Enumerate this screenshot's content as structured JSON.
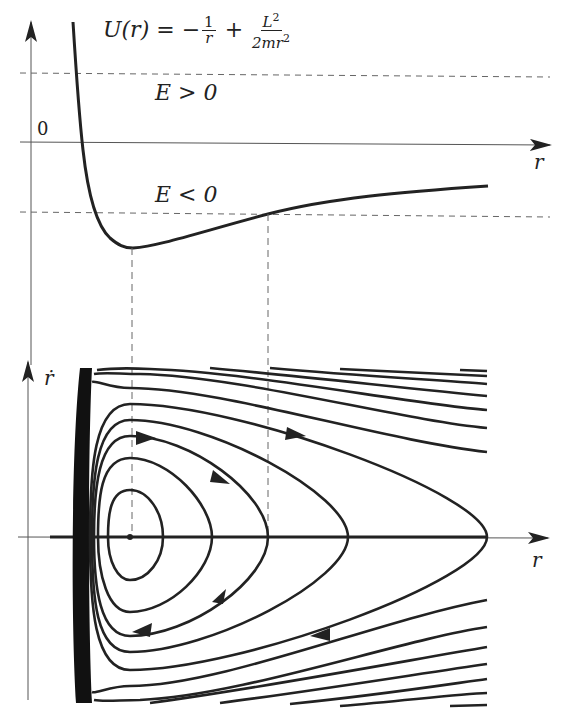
{
  "figure": {
    "top_panel": {
      "formula": {
        "lhs": "U(r) = −",
        "frac1_num": "1",
        "frac1_den": "r",
        "plus": "+",
        "frac2_num": "L",
        "frac2_num_sup": "2",
        "frac2_den": "2mr",
        "frac2_den_sup": "2"
      },
      "labels": {
        "energy_positive": "E > 0",
        "energy_negative": "E < 0",
        "zero": "0",
        "x_axis": "r"
      }
    },
    "bottom_panel": {
      "labels": {
        "y_axis": "ṙ",
        "x_axis": "r"
      }
    },
    "colors": {
      "curve": "#222222",
      "axis": "#555555",
      "dashed": "#666666",
      "background": "#ffffff"
    }
  }
}
